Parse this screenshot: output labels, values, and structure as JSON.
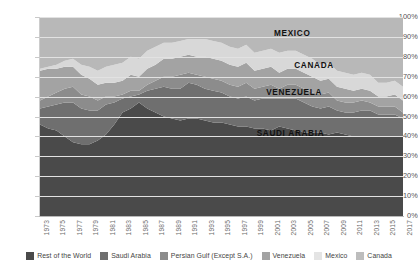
{
  "chart_data": {
    "type": "area",
    "stacked": true,
    "normalized": true,
    "title": "",
    "subtitle": "",
    "xlabel": "",
    "ylabel": "",
    "ylim": [
      0,
      100
    ],
    "ytick_labels": [
      "0%",
      "10%",
      "20%",
      "30%",
      "40%",
      "50%",
      "60%",
      "70%",
      "80%",
      "90%",
      "100%"
    ],
    "ytick_values": [
      0,
      10,
      20,
      30,
      40,
      50,
      60,
      70,
      80,
      90,
      100
    ],
    "grid": true,
    "legend_position": "bottom",
    "x": [
      1973,
      1974,
      1975,
      1976,
      1977,
      1978,
      1979,
      1980,
      1981,
      1982,
      1983,
      1984,
      1985,
      1986,
      1987,
      1988,
      1989,
      1990,
      1991,
      1992,
      1993,
      1994,
      1995,
      1996,
      1997,
      1998,
      1999,
      2000,
      2001,
      2002,
      2003,
      2004,
      2005,
      2006,
      2007,
      2008,
      2009,
      2010,
      2011,
      2012,
      2013,
      2014,
      2015,
      2016,
      2017
    ],
    "xtick_labels": [
      "1973",
      "1975",
      "1977",
      "1979",
      "1981",
      "1983",
      "1985",
      "1987",
      "1989",
      "1991",
      "1993",
      "1995",
      "1997",
      "1999",
      "2001",
      "2003",
      "2005",
      "2007",
      "2009",
      "2011",
      "2013",
      "2015",
      "2017"
    ],
    "series": [
      {
        "name": "Rest of the World",
        "color": "#4a4a4a",
        "values": [
          46,
          44,
          43,
          40,
          37,
          36,
          36,
          38,
          41,
          46,
          52,
          54,
          57,
          54,
          52,
          50,
          49,
          48,
          49,
          49,
          48,
          47,
          47,
          46,
          45,
          45,
          44,
          44,
          43,
          45,
          44,
          43,
          42,
          42,
          42,
          41,
          42,
          41,
          40,
          40,
          40,
          40,
          40,
          40,
          40
        ]
      },
      {
        "name": "Saudi Arabia",
        "color": "#6f6f6f",
        "values": [
          8,
          11,
          13,
          17,
          20,
          18,
          17,
          15,
          15,
          11,
          7,
          6,
          4,
          9,
          12,
          15,
          15,
          16,
          18,
          17,
          16,
          16,
          15,
          14,
          14,
          15,
          14,
          15,
          16,
          14,
          15,
          16,
          15,
          13,
          12,
          14,
          11,
          11,
          12,
          13,
          13,
          11,
          11,
          11,
          9
        ]
      },
      {
        "name": "Persian Gulf (Except S.A.)",
        "color": "#8c8c8c",
        "values": [
          4,
          5,
          6,
          7,
          8,
          7,
          7,
          5,
          4,
          3,
          2,
          3,
          2,
          3,
          4,
          5,
          6,
          7,
          5,
          5,
          6,
          6,
          6,
          6,
          6,
          7,
          6,
          6,
          7,
          5,
          7,
          7,
          7,
          7,
          7,
          7,
          5,
          5,
          5,
          5,
          4,
          4,
          4,
          4,
          3
        ]
      },
      {
        "name": "Venezuela",
        "color": "#a3a3a3",
        "values": [
          15,
          14,
          12,
          11,
          10,
          10,
          9,
          8,
          7,
          7,
          7,
          8,
          7,
          8,
          8,
          9,
          9,
          9,
          9,
          9,
          10,
          10,
          10,
          10,
          10,
          10,
          9,
          9,
          9,
          8,
          8,
          8,
          8,
          8,
          7,
          7,
          7,
          7,
          6,
          6,
          6,
          5,
          5,
          6,
          6
        ]
      },
      {
        "name": "Mexico",
        "color": "#d8d8d8",
        "values": [
          1,
          1,
          2,
          3,
          4,
          5,
          6,
          7,
          8,
          9,
          9,
          9,
          9,
          9,
          9,
          8,
          8,
          8,
          8,
          9,
          9,
          9,
          9,
          9,
          9,
          9,
          9,
          9,
          9,
          10,
          9,
          9,
          9,
          9,
          8,
          8,
          8,
          8,
          8,
          8,
          8,
          7,
          7,
          7,
          7
        ]
      },
      {
        "name": "Canada",
        "color": "#b8b8b8",
        "values": [
          26,
          25,
          24,
          22,
          21,
          24,
          25,
          27,
          25,
          24,
          23,
          20,
          21,
          17,
          15,
          13,
          13,
          12,
          11,
          11,
          11,
          12,
          13,
          15,
          16,
          14,
          18,
          17,
          16,
          18,
          17,
          17,
          19,
          21,
          24,
          23,
          27,
          28,
          29,
          28,
          29,
          33,
          33,
          32,
          35
        ]
      }
    ],
    "annotations": [
      {
        "text": "MEXICO",
        "x_frac": 0.695,
        "y_frac": 0.081,
        "name": "band-label-mexico"
      },
      {
        "text": "CANADA",
        "x_frac": 0.755,
        "y_frac": 0.241,
        "name": "band-label-canada"
      },
      {
        "text": "VENEZUELA",
        "x_frac": 0.7,
        "y_frac": 0.377,
        "name": "band-label-venezuela"
      },
      {
        "text": "SAUDI ARABIA",
        "x_frac": 0.69,
        "y_frac": 0.583,
        "name": "band-label-saudi-arabia"
      }
    ]
  },
  "legend": {
    "items": [
      {
        "label": "Rest of the World",
        "color": "#4a4a4a"
      },
      {
        "label": "Saudi Arabia",
        "color": "#6f6f6f"
      },
      {
        "label": "Persian Gulf (Except S.A.)",
        "color": "#8c8c8c"
      },
      {
        "label": "Venezuela",
        "color": "#a3a3a3"
      },
      {
        "label": "Mexico",
        "color": "#e4e4e4"
      },
      {
        "label": "Canada",
        "color": "#bdbdbd"
      }
    ]
  }
}
